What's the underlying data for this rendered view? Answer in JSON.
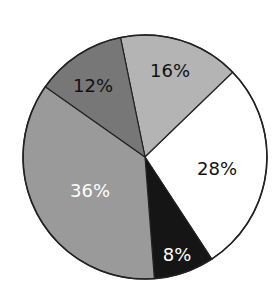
{
  "chart_data": {
    "type": "pie",
    "title": "",
    "start_angle_deg": 348.4,
    "direction": "clockwise",
    "slices": [
      {
        "label": "16%",
        "value": 16,
        "color": "#b4b4b4",
        "text_color": "#111111",
        "label_pos": [
          170,
          70
        ]
      },
      {
        "label": "28%",
        "value": 28,
        "color": "#ffffff",
        "text_color": "#111111",
        "label_pos": [
          217,
          168
        ]
      },
      {
        "label": "8%",
        "value": 8,
        "color": "#151515",
        "text_color": "#ffffff",
        "label_pos": [
          177,
          254
        ]
      },
      {
        "label": "36%",
        "value": 36,
        "color": "#9a9a9a",
        "text_color": "#ffffff",
        "label_pos": [
          90,
          190
        ]
      },
      {
        "label": "12%",
        "value": 12,
        "color": "#777777",
        "text_color": "#111111",
        "label_pos": [
          93,
          85
        ]
      }
    ],
    "center": [
      145,
      157
    ],
    "radius": 122,
    "legend": null
  }
}
